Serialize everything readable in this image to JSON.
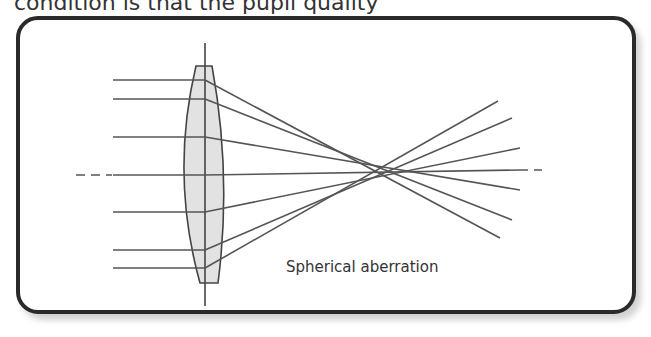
{
  "header": {
    "text": "condition is that the pupil quality"
  },
  "diagram": {
    "title": "Spherical aberration",
    "caption": "Spherical aberration",
    "colors": {
      "line": "#555555",
      "lens_fill": "#e2e2e2",
      "border": "#2a2a2a"
    },
    "optical_axis": {
      "y": 175
    },
    "lens": {
      "center_x": 205,
      "top": 65,
      "bottom": 283
    },
    "rays": [
      {
        "y_in": 80,
        "end": [
          500,
          238
        ]
      },
      {
        "y_in": 99,
        "end": [
          520,
          220
        ]
      },
      {
        "y_in": 137,
        "end": [
          520,
          190
        ]
      },
      {
        "y_in": 175,
        "end": [
          520,
          170
        ]
      },
      {
        "y_in": 212,
        "end": [
          520,
          148
        ]
      },
      {
        "y_in": 250,
        "end": [
          512,
          118
        ]
      },
      {
        "y_in": 268,
        "end": [
          498,
          101
        ]
      }
    ]
  }
}
